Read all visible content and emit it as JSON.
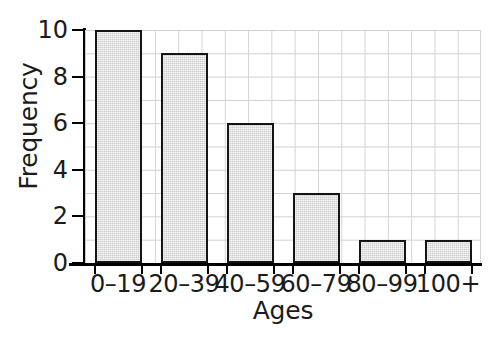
{
  "chart_data": {
    "type": "bar",
    "title": "",
    "subtitle": "",
    "xlabel": "Ages",
    "ylabel": "Frequency",
    "categories": [
      "0–19",
      "20–39",
      "40–59",
      "60–79",
      "80–99",
      "100+"
    ],
    "values": [
      10,
      9,
      6,
      3,
      1,
      1
    ],
    "ylim": [
      0,
      10
    ],
    "ytick_labels": [
      "0",
      "2",
      "4",
      "6",
      "8",
      "10"
    ],
    "ytick_values": [
      0,
      2,
      4,
      6,
      8,
      10
    ],
    "grid": true,
    "grid_minor": true,
    "legend": null,
    "annotations": [],
    "colors": {
      "bar_fill": "#cdcdcd",
      "bar_stroke": "#141414",
      "axis": "#000000",
      "grid": "#d3d3d3",
      "text": "#1b1b1b",
      "background": "#ffffff"
    }
  }
}
